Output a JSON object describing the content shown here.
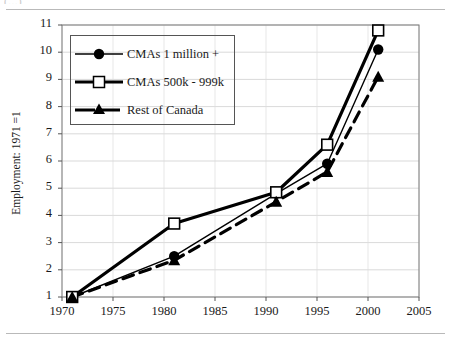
{
  "page": {
    "clipped_header_text": "(...)"
  },
  "chart_data": {
    "type": "line",
    "title": "",
    "xlabel": "",
    "ylabel": "Employment: 1971 =1",
    "xlim": [
      1970,
      2005
    ],
    "ylim": [
      1,
      11
    ],
    "xticks": [
      1970,
      1975,
      1980,
      1985,
      1990,
      1995,
      2000,
      2005
    ],
    "yticks": [
      1,
      2,
      3,
      4,
      5,
      6,
      7,
      8,
      9,
      10,
      11
    ],
    "grid": true,
    "legend_position": "upper-left",
    "x": [
      1971,
      1981,
      1991,
      1996,
      2001
    ],
    "series": [
      {
        "name": "CMAs 1 million +",
        "marker": "filled-circle",
        "line_style": "solid-thin",
        "color": "#000000",
        "values": [
          1.0,
          2.5,
          4.8,
          5.9,
          10.1
        ]
      },
      {
        "name": "CMAs 500k - 999k",
        "marker": "open-square",
        "line_style": "solid-thick",
        "color": "#000000",
        "values": [
          1.0,
          3.7,
          4.85,
          6.6,
          10.8
        ]
      },
      {
        "name": "Rest of Canada",
        "marker": "filled-triangle",
        "line_style": "dashed-thick",
        "color": "#000000",
        "values": [
          1.0,
          2.35,
          4.5,
          5.6,
          9.1
        ]
      }
    ]
  },
  "axis": {
    "x_tick_labels": [
      "1970",
      "1975",
      "1980",
      "1985",
      "1990",
      "1995",
      "2000",
      "2005"
    ],
    "y_tick_labels": [
      "1",
      "2",
      "3",
      "4",
      "5",
      "6",
      "7",
      "8",
      "9",
      "10",
      "11"
    ]
  },
  "legend": {
    "items": [
      {
        "label": "CMAs 1 million +"
      },
      {
        "label": "CMAs 500k - 999k"
      },
      {
        "label": "Rest of Canada"
      }
    ]
  }
}
